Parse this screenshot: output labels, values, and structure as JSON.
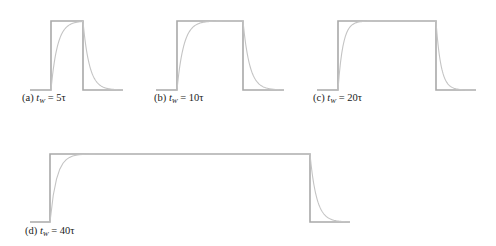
{
  "figure": {
    "colors": {
      "pulse": "#a9a9a9",
      "response": "#c4c4c4",
      "text": "#1a1a1a"
    },
    "panels": [
      {
        "id": "a",
        "prefix": "(a)",
        "var": "t",
        "sub": "W",
        "eq": "= 5τ",
        "tw_over_tau": 5,
        "x0": 30,
        "rise": 51,
        "fall": 83,
        "x1": 123,
        "top": 21,
        "base": 90,
        "cap_x": 22,
        "cap_y": 92
      },
      {
        "id": "b",
        "prefix": "(b)",
        "var": "t",
        "sub": "W",
        "eq": "= 10τ",
        "tw_over_tau": 10,
        "x0": 156,
        "rise": 177,
        "fall": 243,
        "x1": 284,
        "top": 21,
        "base": 90,
        "cap_x": 154,
        "cap_y": 92
      },
      {
        "id": "c",
        "prefix": "(c)",
        "var": "t",
        "sub": "W",
        "eq": "= 20τ",
        "tw_over_tau": 20,
        "x0": 317,
        "rise": 338,
        "fall": 436,
        "x1": 476,
        "top": 21,
        "base": 90,
        "cap_x": 313,
        "cap_y": 92
      },
      {
        "id": "d",
        "prefix": "(d)",
        "var": "t",
        "sub": "W",
        "eq": "= 40τ",
        "tw_over_tau": 40,
        "x0": 30,
        "rise": 50,
        "fall": 310,
        "x1": 350,
        "top": 154,
        "base": 222,
        "cap_x": 25,
        "cap_y": 225
      }
    ]
  }
}
